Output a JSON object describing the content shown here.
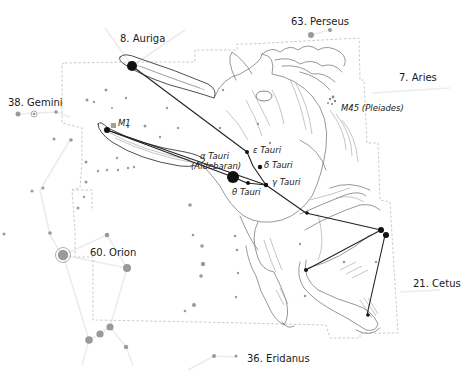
{
  "constellations": [
    {
      "id": "auriga",
      "label": "8. Auriga"
    },
    {
      "id": "perseus",
      "label": "63. Perseus"
    },
    {
      "id": "aries",
      "label": "7. Aries"
    },
    {
      "id": "gemini",
      "label": "38. Gemini"
    },
    {
      "id": "orion",
      "label": "60. Orion"
    },
    {
      "id": "cetus",
      "label": "21. Cetus"
    },
    {
      "id": "eridanus",
      "label": "36. Eridanus"
    }
  ],
  "objects": {
    "m1": "M1",
    "m45": "M45 (Pleiades)"
  },
  "stars": {
    "alpha_line1": "α Tauri",
    "alpha_line2": "(Aldebaran)",
    "epsilon": "ε Tauri",
    "delta": "δ Tauri",
    "gamma": "γ Tauri",
    "theta": "θ Tauri"
  },
  "colors": {
    "star_dark": "#111111",
    "star_gray": "#9a9a9a",
    "boundary": "#bdbdbd",
    "figure_line": "#ececec"
  }
}
